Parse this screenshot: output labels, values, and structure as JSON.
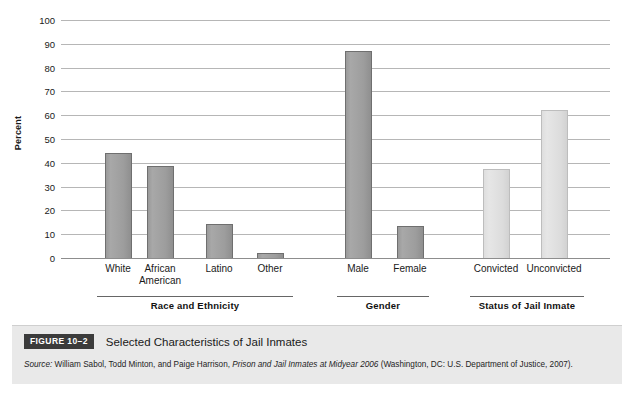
{
  "chart_data": {
    "type": "bar",
    "title": "Selected Characteristics of Jail Inmates",
    "xlabel": "",
    "ylabel": "Percent",
    "ylim": [
      0,
      100
    ],
    "yticks": [
      0,
      10,
      20,
      30,
      40,
      50,
      60,
      70,
      80,
      90,
      100
    ],
    "grid": true,
    "legend": "none",
    "categories": [
      "White",
      "African American",
      "Latino",
      "Other",
      "Male",
      "Female",
      "Convicted",
      "Unconvicted"
    ],
    "values": [
      44,
      38.5,
      14.5,
      2,
      87,
      13.5,
      37.5,
      62
    ],
    "groups": [
      {
        "name": "Race and Ethnicity",
        "shade": "dark",
        "bars": [
          {
            "label": "White",
            "value": 44
          },
          {
            "label": "African\nAmerican",
            "value": 38.5
          },
          {
            "label": "Latino",
            "value": 14.5
          },
          {
            "label": "Other",
            "value": 2
          }
        ]
      },
      {
        "name": "Gender",
        "shade": "dark",
        "bars": [
          {
            "label": "Male",
            "value": 87
          },
          {
            "label": "Female",
            "value": 13.5
          }
        ]
      },
      {
        "name": "Status of Jail Inmate",
        "shade": "light",
        "bars": [
          {
            "label": "Convicted",
            "value": 37.5
          },
          {
            "label": "Unconvicted",
            "value": 62
          }
        ]
      }
    ]
  },
  "axis": {
    "y_title": "Percent",
    "ticks": [
      "100",
      "90",
      "80",
      "70",
      "60",
      "50",
      "40",
      "30",
      "20",
      "10",
      "0"
    ]
  },
  "groups": {
    "race": "Race and Ethnicity",
    "gender": "Gender",
    "status": "Status of Jail Inmate"
  },
  "labels": {
    "white": "White",
    "african_american": "African\nAmerican",
    "latino": "Latino",
    "other": "Other",
    "male": "Male",
    "female": "Female",
    "convicted": "Convicted",
    "unconvicted": "Unconvicted"
  },
  "caption": {
    "badge": "FIGURE 10–2",
    "title": "Selected Characteristics of Jail Inmates",
    "source_prefix": "Source:",
    "source_authors": " William Sabol, Todd Minton, and Paige Harrison, ",
    "source_work": "Prison and Jail Inmates at Midyear 2006",
    "source_suffix": " (Washington, DC: U.S. Department of Justice, 2007)."
  },
  "colors": {
    "bar_dark": "#9d9d9d",
    "bar_dark_border": "#6f6f6f",
    "bar_light": "#dedede",
    "bar_light_border": "#bdbdbd",
    "gridline": "#b6b6b6",
    "caption_bg": "#e9e9e9",
    "badge_bg": "#3b3b3b"
  }
}
